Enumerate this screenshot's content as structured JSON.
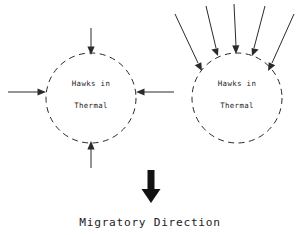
{
  "figure": {
    "background_color": "#ffffff",
    "line_color": "#2a2a2a",
    "text_color": "#1d1d1d",
    "bold_arrow_color": "#121212",
    "caption": "Migratory Direction",
    "thermals": [
      {
        "id": "left-thermal",
        "label_line1": "Hawks in",
        "label_line2": "Thermal",
        "center_x": 91,
        "center_y": 98,
        "radius": 45,
        "arrow_count": 4,
        "arrow_directions": [
          "down",
          "right",
          "left",
          "up"
        ]
      },
      {
        "id": "right-thermal",
        "label_line1": "Hawks in",
        "label_line2": "Thermal",
        "center_x": 237,
        "center_y": 98,
        "radius": 45,
        "arrow_count": 5,
        "arrow_directions": [
          "down-right",
          "down-right",
          "down",
          "down-left",
          "down-left"
        ]
      }
    ],
    "bold_arrow": {
      "name": "migratory-direction-arrow",
      "direction": "down",
      "x": 151,
      "top_y": 170,
      "bottom_y": 203
    }
  }
}
